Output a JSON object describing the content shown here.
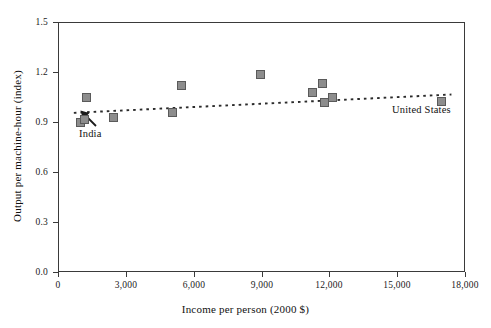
{
  "chart_data": {
    "type": "scatter",
    "title": "",
    "xlabel": "Income per person (2000 $)",
    "ylabel": "Output per machine-hour (index)",
    "xlim": [
      0,
      18000
    ],
    "ylim": [
      0.0,
      1.5
    ],
    "xticks": [
      0,
      3000,
      6000,
      9000,
      12000,
      15000,
      18000
    ],
    "xtick_labels": [
      "0",
      "3,000",
      "6,000",
      "9,000",
      "12,000",
      "15,000",
      "18,000"
    ],
    "yticks": [
      0.0,
      0.3,
      0.6,
      0.9,
      1.2,
      1.5
    ],
    "ytick_labels": [
      "0.0",
      "0.3",
      "0.6",
      "0.9",
      "1.2",
      "1.5"
    ],
    "grid": false,
    "legend": "none",
    "marker_fill": "#8d8d8d",
    "marker_edge": "#5a5a5a",
    "trendline": {
      "style": "dotted",
      "color": "#2b2b2b",
      "x": [
        700,
        17400
      ],
      "y": [
        0.955,
        1.065
      ]
    },
    "points": [
      {
        "x": 1000,
        "y": 0.9,
        "label": "India"
      },
      {
        "x": 1150,
        "y": 0.915,
        "label": ""
      },
      {
        "x": 1250,
        "y": 1.05,
        "label": ""
      },
      {
        "x": 2450,
        "y": 0.93,
        "label": ""
      },
      {
        "x": 5050,
        "y": 0.96,
        "label": ""
      },
      {
        "x": 5450,
        "y": 1.12,
        "label": ""
      },
      {
        "x": 8950,
        "y": 1.185,
        "label": ""
      },
      {
        "x": 11250,
        "y": 1.08,
        "label": ""
      },
      {
        "x": 11700,
        "y": 1.13,
        "label": ""
      },
      {
        "x": 11800,
        "y": 1.02,
        "label": ""
      },
      {
        "x": 12150,
        "y": 1.05,
        "label": ""
      },
      {
        "x": 16950,
        "y": 1.025,
        "label": "United States"
      }
    ],
    "annotations": [
      {
        "text": "India",
        "x": 1050,
        "y": 0.795,
        "arrow": true
      },
      {
        "text": "United States",
        "x": 16100,
        "y": 0.945,
        "arrow": false
      }
    ]
  }
}
